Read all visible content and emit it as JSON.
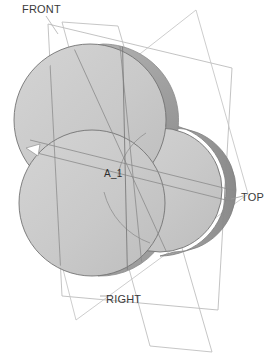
{
  "viewport": {
    "width": 274,
    "height": 358,
    "background_color": "#ffffff"
  },
  "model": {
    "name": "cloverleaf-disc-solid",
    "description": "Three overlapping cylindrical discs shown in isometric shaded view",
    "face_color": "#c8c8c8",
    "face_color_light": "#d2d2d2",
    "rim_color": "#9a9a9a",
    "rim_color_dark": "#8c8c8c",
    "edge_color": "#6e6e6e",
    "discs": [
      {
        "id": "disc-upper-left",
        "cx": 103,
        "cy": 120,
        "rx": 76,
        "ry": 76
      },
      {
        "id": "disc-right",
        "cx": 174,
        "cy": 190,
        "rx": 62,
        "ry": 62
      },
      {
        "id": "disc-lower-left",
        "cx": 98,
        "cy": 203,
        "rx": 73,
        "ry": 73
      }
    ]
  },
  "datum_planes": [
    {
      "id": "plane-front",
      "label": "FRONT",
      "label_x": 22,
      "label_y": 13,
      "color": "#b4b4b4"
    },
    {
      "id": "plane-top",
      "label": "TOP",
      "label_x": 241,
      "label_y": 200,
      "color": "#b4b4b4"
    },
    {
      "id": "plane-right",
      "label": "RIGHT",
      "label_x": 106,
      "label_y": 303,
      "color": "#b4b4b4"
    }
  ],
  "datum_axis": {
    "id": "axis-a1",
    "label": "A_1",
    "label_x": 105,
    "label_y": 176,
    "color": "#6e6e6e"
  },
  "colors": {
    "background": "#ffffff",
    "face": "#c8c8c8",
    "rim": "#9a9a9a",
    "plane_outline": "#b4b4b4",
    "silhouette": "#6e6e6e",
    "text": "#3a3a3a"
  }
}
